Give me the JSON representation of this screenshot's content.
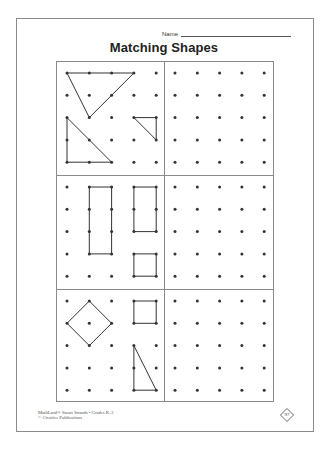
{
  "header": {
    "name_label": "Name",
    "title": "Matching Shapes"
  },
  "worksheet": {
    "dot_grid": {
      "columns": 5,
      "rows": 5,
      "spacing_px": 22.3
    },
    "colors": {
      "ink": "#333333",
      "border": "#8a8a8a"
    },
    "panels": [
      {
        "id": "row1-left",
        "role": "model",
        "shapes": [
          {
            "name": "large-triangle",
            "points": [
              [
                0,
                0
              ],
              [
                3,
                0
              ],
              [
                1,
                2
              ]
            ]
          },
          {
            "name": "right-triangle",
            "points": [
              [
                0,
                2
              ],
              [
                0,
                4
              ],
              [
                2,
                4
              ]
            ]
          },
          {
            "name": "small-triangle",
            "points": [
              [
                3,
                2
              ],
              [
                4,
                2
              ],
              [
                4,
                3
              ]
            ]
          }
        ]
      },
      {
        "id": "row1-right",
        "role": "copy-area",
        "shapes": []
      },
      {
        "id": "row2-left",
        "role": "model",
        "shapes": [
          {
            "name": "tall-rectangle",
            "points": [
              [
                1,
                0
              ],
              [
                2,
                0
              ],
              [
                2,
                3
              ],
              [
                1,
                3
              ]
            ]
          },
          {
            "name": "short-rectangle",
            "points": [
              [
                3,
                0
              ],
              [
                4,
                0
              ],
              [
                4,
                2
              ],
              [
                3,
                2
              ]
            ]
          },
          {
            "name": "small-square",
            "points": [
              [
                3,
                3
              ],
              [
                4,
                3
              ],
              [
                4,
                4
              ],
              [
                3,
                4
              ]
            ]
          }
        ]
      },
      {
        "id": "row2-right",
        "role": "copy-area",
        "shapes": []
      },
      {
        "id": "row3-left",
        "role": "model",
        "shapes": [
          {
            "name": "diamond",
            "points": [
              [
                1,
                0
              ],
              [
                2,
                1
              ],
              [
                1,
                2
              ],
              [
                0,
                1
              ]
            ]
          },
          {
            "name": "square",
            "points": [
              [
                3,
                0
              ],
              [
                4,
                0
              ],
              [
                4,
                1
              ],
              [
                3,
                1
              ]
            ]
          },
          {
            "name": "tall-triangle",
            "points": [
              [
                3,
                2
              ],
              [
                3,
                4
              ],
              [
                4,
                4
              ]
            ]
          }
        ]
      },
      {
        "id": "row3-right",
        "role": "copy-area",
        "shapes": []
      }
    ]
  },
  "footer": {
    "line1": "MathLand® Smart Strands • Grades K–2",
    "line2": "© Creative Publications",
    "page_number": "97"
  }
}
